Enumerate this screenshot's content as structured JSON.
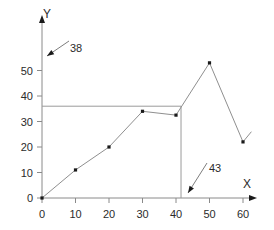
{
  "chart_data": {
    "type": "line",
    "title": "",
    "xlabel": "X",
    "ylabel": "Y",
    "xlim": [
      0,
      62
    ],
    "ylim": [
      0,
      56
    ],
    "grid": false,
    "legend": false,
    "x_ticks": [
      0,
      10,
      20,
      30,
      40,
      50,
      60
    ],
    "x_tick_labels": [
      "0",
      "10",
      "20",
      "30",
      "40",
      "50",
      "60"
    ],
    "y_ticks": [
      0,
      10,
      20,
      30,
      40,
      50
    ],
    "y_tick_labels": [
      "0",
      "10",
      "20",
      "30",
      "40",
      "50"
    ],
    "series": [
      {
        "name": "series-1",
        "x": [
          0,
          10,
          20,
          30,
          40,
          50,
          60
        ],
        "y": [
          0,
          11,
          20,
          34,
          32.5,
          53,
          22
        ],
        "marker": "square",
        "marker_color": "#1a1a1a",
        "line_color": "#8f8f8f"
      }
    ],
    "trailing_segment": {
      "name": "trailing-stub",
      "x": [
        60,
        62.5
      ],
      "y": [
        22,
        26
      ]
    },
    "reference_lines": [
      {
        "name": "horizontal-reference",
        "orientation": "horizontal",
        "value": 36,
        "x_start": 0,
        "x_end": 41.5,
        "color": "#9a9a9a"
      },
      {
        "name": "vertical-reference",
        "orientation": "vertical",
        "value": 41.5,
        "y_start": 0,
        "y_end": 36,
        "color": "#9a9a9a"
      }
    ],
    "annotations": [
      {
        "name": "annotation-38",
        "text": "38",
        "text_x": 70,
        "text_y": 52,
        "arrow_tail_x": 69,
        "arrow_tail_y": 41,
        "arrow_tip_x": 47,
        "arrow_tip_y": 56
      },
      {
        "name": "annotation-43",
        "text": "43",
        "text_x": 209,
        "text_y": 172,
        "arrow_tail_x": 207,
        "arrow_tail_y": 163,
        "arrow_tip_x": 188,
        "arrow_tip_y": 193
      }
    ]
  },
  "axes": {
    "x_title": "X",
    "y_title": "Y"
  }
}
